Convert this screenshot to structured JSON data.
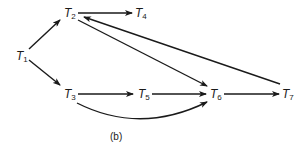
{
  "diagram": {
    "caption": "(b)",
    "nodes": [
      {
        "id": "T1",
        "letter": "T",
        "sub": "1",
        "x": 16,
        "y": 50
      },
      {
        "id": "T2",
        "letter": "T",
        "sub": "2",
        "x": 64,
        "y": 7
      },
      {
        "id": "T3",
        "letter": "T",
        "sub": "3",
        "x": 64,
        "y": 88
      },
      {
        "id": "T4",
        "letter": "T",
        "sub": "4",
        "x": 135,
        "y": 7
      },
      {
        "id": "T5",
        "letter": "T",
        "sub": "5",
        "x": 138,
        "y": 88
      },
      {
        "id": "T6",
        "letter": "T",
        "sub": "6",
        "x": 210,
        "y": 88
      },
      {
        "id": "T7",
        "letter": "T",
        "sub": "7",
        "x": 282,
        "y": 88
      }
    ],
    "edges": [
      {
        "from": "T1",
        "to": "T2"
      },
      {
        "from": "T1",
        "to": "T3"
      },
      {
        "from": "T2",
        "to": "T4"
      },
      {
        "from": "T2",
        "to": "T6"
      },
      {
        "from": "T7",
        "to": "T2"
      },
      {
        "from": "T3",
        "to": "T5"
      },
      {
        "from": "T5",
        "to": "T6"
      },
      {
        "from": "T3",
        "to": "T6",
        "curved": true
      },
      {
        "from": "T6",
        "to": "T7"
      }
    ]
  }
}
